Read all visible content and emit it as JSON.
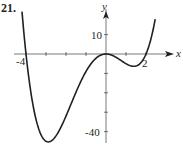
{
  "problem_number": "21.",
  "chart_data": {
    "type": "line",
    "title": "",
    "xlabel": "x",
    "ylabel": "y",
    "function": "f(x) = x^2 (x + 4)(x - 2)",
    "x_tick_labels": [
      "-4",
      "2"
    ],
    "y_tick_labels": [
      "10",
      "-40"
    ],
    "x_ticks": [
      -4,
      -3,
      -2,
      -1,
      0,
      1,
      2
    ],
    "y_ticks": [
      10,
      0,
      -10,
      -20,
      -30,
      -40
    ],
    "xlim": [
      -4.2,
      2.5
    ],
    "ylim": [
      -46,
      16
    ],
    "grid": false,
    "series": [
      {
        "name": "f(x)",
        "x": [
          -4.1,
          -4.0,
          -3.5,
          -3.0,
          -2.5,
          -2.0,
          -1.5,
          -1.0,
          -0.5,
          0.0,
          0.5,
          1.0,
          1.5,
          2.0,
          2.2,
          2.45
        ],
        "values": [
          15.2,
          0,
          -33.7,
          -45,
          -39.1,
          -24,
          -11.8,
          -5.5,
          -1.6,
          0,
          -0.84,
          -5,
          -4.7,
          0,
          6.0,
          16.7
        ]
      }
    ],
    "key_points": {
      "x_intercepts": [
        -4,
        0,
        2
      ],
      "local_min_left": [
        -3,
        -45
      ],
      "local_max": [
        0,
        0
      ],
      "local_min_right": [
        1,
        -5
      ]
    },
    "colors": {
      "curve": "#231f20",
      "axes": "#231f20"
    }
  }
}
